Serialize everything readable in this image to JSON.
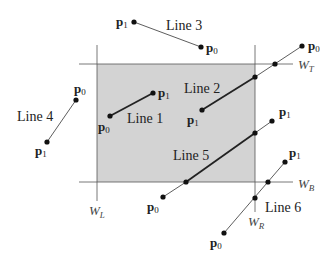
{
  "diagram": {
    "type": "line-clipping",
    "window": {
      "x0": 97,
      "y0": 64,
      "x1": 255,
      "y1": 182,
      "fill": "#d3d3d3"
    },
    "boundary_labels": {
      "left": {
        "main": "W",
        "sub": "L"
      },
      "right": {
        "main": "W",
        "sub": "R"
      },
      "top": {
        "main": "W",
        "sub": "T"
      },
      "bottom": {
        "main": "W",
        "sub": "B"
      }
    },
    "lines": [
      {
        "label": "Line 1",
        "p0": "p",
        "p0_sub": "0",
        "p1": "p",
        "p1_sub": "1",
        "status": "fully inside"
      },
      {
        "label": "Line 2",
        "p0": "p",
        "p0_sub": "0",
        "p1": "p",
        "p1_sub": "1",
        "status": "clipped at right/top"
      },
      {
        "label": "Line 3",
        "p0": "p",
        "p0_sub": "0",
        "p1": "p",
        "p1_sub": "1",
        "status": "outside (above)"
      },
      {
        "label": "Line 4",
        "p0": "p",
        "p0_sub": "0",
        "p1": "p",
        "p1_sub": "1",
        "status": "outside (left)"
      },
      {
        "label": "Line 5",
        "p0": "p",
        "p0_sub": "0",
        "p1": "p",
        "p1_sub": "1",
        "status": "clipped at both ends"
      },
      {
        "label": "Line 6",
        "p0": "p",
        "p0_sub": "0",
        "p1": "p",
        "p1_sub": "1",
        "status": "outside (corner)"
      }
    ],
    "colors": {
      "window_fill": "#d3d3d3",
      "boundary": "#555555",
      "line": "#333333"
    }
  }
}
